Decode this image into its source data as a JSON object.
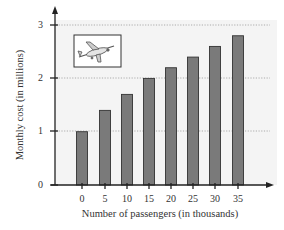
{
  "chart_data": {
    "type": "bar",
    "title": "",
    "xlabel": "Number of passengers (in thousands)",
    "ylabel": "Monthly cost (in millions)",
    "categories": [
      "0",
      "5",
      "10",
      "15",
      "20",
      "25",
      "30",
      "35"
    ],
    "values": [
      1.0,
      1.4,
      1.7,
      2.0,
      2.2,
      2.4,
      2.6,
      2.8
    ],
    "yticks": [
      "0",
      "1",
      "2",
      "3"
    ],
    "ylim": [
      0,
      3.2
    ],
    "grid": "horizontal dotted at 1, 2, 3",
    "legend": "none",
    "inset_image": "airplane-illustration",
    "bar_color": "#7a7a7a",
    "bar_edge_color": "#333333",
    "plot_background": "#f3f3f3"
  }
}
